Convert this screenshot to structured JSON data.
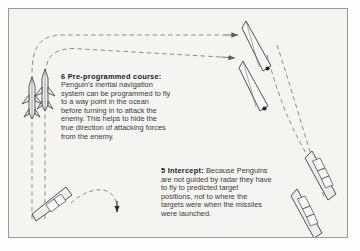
{
  "figure": {
    "background_color": "#f4f4f3",
    "frame_border_color": "#9a9a9a",
    "ink_color": "#4a4a4a",
    "text_color": "#3a3a3a",
    "heading_color": "#1a1a1a"
  },
  "callouts": [
    {
      "number": "6",
      "heading": "6 Pre-programmed course:",
      "body_lines": [
        "Penguin's inertial navigation",
        "system can be programmed to fly",
        "to a way point in the ocean",
        "before turning in to attack the",
        "enemy. This helps to hide the",
        "true direction of attacking forces",
        "from the enemy."
      ]
    },
    {
      "number": "5",
      "heading": "5 Intercept:",
      "lead_text": " Because Penguins",
      "body_lines": [
        "are not guided by radar they have",
        "to fly to predicted target",
        "positions, not to where the",
        "targets were when the missiles",
        "were launched."
      ]
    }
  ],
  "graphics": {
    "missiles": [
      {
        "name": "missile-left",
        "x": 31,
        "y": 95
      },
      {
        "name": "missile-right",
        "x": 44,
        "y": 88
      }
    ],
    "ships": [
      {
        "name": "enemy-ship-top",
        "label": "target vessel upper"
      },
      {
        "name": "enemy-ship-upper-middle",
        "label": "target vessel second"
      },
      {
        "name": "enemy-ship-lower-right",
        "label": "target vessel third"
      },
      {
        "name": "enemy-ship-bottom-right",
        "label": "target vessel fourth"
      },
      {
        "name": "launch-ship",
        "label": "launching vessel"
      }
    ],
    "paths": [
      {
        "name": "flight-path-outer",
        "style": "dashed"
      },
      {
        "name": "flight-path-inner",
        "style": "dashed"
      },
      {
        "name": "intercept-path",
        "style": "dashed"
      },
      {
        "name": "launch-path",
        "style": "dashed"
      }
    ]
  }
}
